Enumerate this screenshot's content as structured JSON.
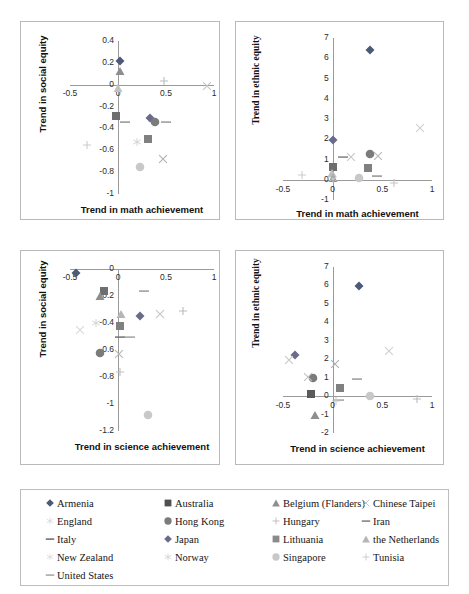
{
  "figure": {
    "title": "",
    "series_legend": [
      {
        "name": "Armenia",
        "marker": "diamond",
        "color": "#4a5a78"
      },
      {
        "name": "Australia",
        "marker": "square",
        "color": "#4f4f4f"
      },
      {
        "name": "Belgium (Flanders)",
        "marker": "triangle",
        "color": "#8e8e8e"
      },
      {
        "name": "Chinese Taipei",
        "marker": "x",
        "color": "#c0c0c0"
      },
      {
        "name": "England",
        "marker": "star",
        "color": "#d5d5d5"
      },
      {
        "name": "Hong Kong",
        "marker": "circle",
        "color": "#7b7b7b"
      },
      {
        "name": "Hungary",
        "marker": "plus",
        "color": "#bdbdbd"
      },
      {
        "name": "Iran",
        "marker": "dash",
        "color": "#6f6f6f"
      },
      {
        "name": "Italy",
        "marker": "dash",
        "color": "#5a5a5a"
      },
      {
        "name": "Japan",
        "marker": "diamond",
        "color": "#6a6a8a"
      },
      {
        "name": "Lithuania",
        "marker": "square",
        "color": "#8a8a8a"
      },
      {
        "name": "the Netherlands",
        "marker": "triangle",
        "color": "#b5b5b5"
      },
      {
        "name": "New Zealand",
        "marker": "star",
        "color": "#d8d8d8"
      },
      {
        "name": "Norway",
        "marker": "star",
        "color": "#cfcfcf"
      },
      {
        "name": "Singapore",
        "marker": "circle",
        "color": "#c8c8c8"
      },
      {
        "name": "Tunisia",
        "marker": "plus",
        "color": "#cccccc"
      },
      {
        "name": "United States",
        "marker": "dash",
        "color": "#9b9b9b"
      }
    ]
  },
  "chart_data": [
    {
      "id": "math-social",
      "type": "scatter",
      "position": "top-left",
      "title": "",
      "xlabel": "Trend in math achievement",
      "ylabel": "Trend in social equity",
      "xlim": [
        -0.5,
        1
      ],
      "ylim": [
        -1,
        0.4
      ],
      "xticks": [
        -0.5,
        0,
        0.5,
        1
      ],
      "xticklabels": [
        "-0.5",
        "0",
        "0.5",
        "1"
      ],
      "yticks": [
        -1,
        -0.8,
        -0.6,
        -0.4,
        -0.2,
        0,
        0.2,
        0.4
      ],
      "yticklabels": [
        "-1",
        "-0.8",
        "-0.6",
        "-0.4",
        "-0.2",
        "0",
        "0.2",
        "0.4"
      ],
      "grid": false,
      "points": [
        {
          "name": "Armenia",
          "x": 0.02,
          "y": 0.22,
          "marker": "diamond",
          "color": "#4a5a78"
        },
        {
          "name": "Belgium (Flanders)",
          "x": 0.02,
          "y": 0.13,
          "marker": "triangle",
          "color": "#8e8e8e"
        },
        {
          "name": "the Netherlands",
          "x": 0.0,
          "y": -0.03,
          "marker": "triangle",
          "color": "#c2c2c2"
        },
        {
          "name": "Hungary",
          "x": 0.48,
          "y": 0.03,
          "marker": "plus",
          "color": "#bdbdbd"
        },
        {
          "name": "Chinese Taipei",
          "x": 0.93,
          "y": -0.01,
          "marker": "x",
          "color": "#c5c5c5"
        },
        {
          "name": "Australia",
          "x": -0.02,
          "y": -0.29,
          "marker": "square",
          "color": "#6e6e6e"
        },
        {
          "name": "United States",
          "x": 0.07,
          "y": -0.34,
          "marker": "dash",
          "color": "#9b9b9b"
        },
        {
          "name": "Japan",
          "x": 0.33,
          "y": -0.3,
          "marker": "diamond",
          "color": "#6a6a8a"
        },
        {
          "name": "Hong Kong",
          "x": 0.39,
          "y": -0.34,
          "marker": "circle",
          "color": "#7b7b7b"
        },
        {
          "name": "Iran",
          "x": 0.5,
          "y": -0.34,
          "marker": "dash",
          "color": "#a0a0a0"
        },
        {
          "name": "Norway",
          "x": 0.2,
          "y": -0.52,
          "marker": "star",
          "color": "#cfcfcf"
        },
        {
          "name": "Lithuania",
          "x": 0.31,
          "y": -0.5,
          "marker": "square",
          "color": "#808080"
        },
        {
          "name": "Tunisia",
          "x": -0.32,
          "y": -0.55,
          "marker": "plus",
          "color": "#cccccc"
        },
        {
          "name": "Singapore",
          "x": 0.23,
          "y": -0.75,
          "marker": "circle",
          "color": "#c8c8c8"
        },
        {
          "name": "England",
          "x": 0.47,
          "y": -0.68,
          "marker": "x",
          "color": "#b0b0b0"
        }
      ]
    },
    {
      "id": "math-ethnic",
      "type": "scatter",
      "position": "top-right",
      "title": "",
      "xlabel": "Trend in math achievement",
      "ylabel": "Trend in ethnic equity",
      "xlim": [
        -0.5,
        1
      ],
      "ylim": [
        -1,
        7
      ],
      "xticks": [
        -0.5,
        0,
        0.5,
        1
      ],
      "xticklabels": [
        "-0.5",
        "0",
        "0.5",
        "1"
      ],
      "yticks": [
        -1,
        0,
        1,
        2,
        3,
        4,
        5,
        6,
        7
      ],
      "yticklabels": [
        "-1",
        "0",
        "1",
        "2",
        "3",
        "4",
        "5",
        "6",
        "7"
      ],
      "grid": false,
      "points": [
        {
          "name": "Armenia",
          "x": 0.38,
          "y": 6.4,
          "marker": "diamond",
          "color": "#4a5a78"
        },
        {
          "name": "Japan",
          "x": 0.0,
          "y": 1.97,
          "marker": "diamond",
          "color": "#6a6a8a"
        },
        {
          "name": "Chinese Taipei",
          "x": 0.88,
          "y": 2.55,
          "marker": "x",
          "color": "#d0d0d0"
        },
        {
          "name": "Hong Kong",
          "x": 0.38,
          "y": 1.27,
          "marker": "circle",
          "color": "#7b7b7b"
        },
        {
          "name": "England",
          "x": 0.46,
          "y": 1.18,
          "marker": "x",
          "color": "#b8b8b8"
        },
        {
          "name": "Italy",
          "x": 0.1,
          "y": 1.1,
          "marker": "dash",
          "color": "#8a8a8a"
        },
        {
          "name": "New Zealand",
          "x": 0.18,
          "y": 1.12,
          "marker": "x",
          "color": "#c7c7c7"
        },
        {
          "name": "Australia",
          "x": 0.0,
          "y": 0.62,
          "marker": "square",
          "color": "#6e6e6e"
        },
        {
          "name": "Lithuania",
          "x": 0.36,
          "y": 0.58,
          "marker": "square",
          "color": "#808080"
        },
        {
          "name": "the Netherlands",
          "x": -0.01,
          "y": 0.33,
          "marker": "triangle",
          "color": "#bdbdbd"
        },
        {
          "name": "Belgium (Flanders)",
          "x": 0.0,
          "y": 0.1,
          "marker": "triangle",
          "color": "#8e8e8e"
        },
        {
          "name": "Singapore",
          "x": 0.27,
          "y": 0.1,
          "marker": "circle",
          "color": "#c8c8c8"
        },
        {
          "name": "United States",
          "x": 0.45,
          "y": 0.18,
          "marker": "dash",
          "color": "#9b9b9b"
        },
        {
          "name": "Tunisia",
          "x": -0.31,
          "y": 0.22,
          "marker": "plus",
          "color": "#cccccc"
        },
        {
          "name": "Hungary",
          "x": 0.62,
          "y": -0.14,
          "marker": "plus",
          "color": "#c4c4c4"
        },
        {
          "name": "Norway",
          "x": 0.0,
          "y": 0.02,
          "marker": "star",
          "color": "#cfcfcf"
        }
      ]
    },
    {
      "id": "science-social",
      "type": "scatter",
      "position": "bottom-left",
      "title": "",
      "xlabel": "Trend in science achievement",
      "ylabel": "Trend in social equity",
      "xlim": [
        -0.5,
        1
      ],
      "ylim": [
        -1.2,
        0
      ],
      "xticks": [
        -0.5,
        0,
        0.5,
        1
      ],
      "xticklabels": [
        "-0.5",
        "0",
        "0.5",
        "1"
      ],
      "yticks": [
        -1.2,
        -1,
        -0.8,
        -0.6,
        -0.4,
        -0.2,
        0
      ],
      "yticklabels": [
        "-1.2",
        "-1",
        "-0.8",
        "-0.6",
        "-0.4",
        "-0.2",
        "0"
      ],
      "grid": false,
      "points": [
        {
          "name": "Armenia",
          "x": -0.44,
          "y": -0.03,
          "marker": "diamond",
          "color": "#4a5a78"
        },
        {
          "name": "Australia",
          "x": -0.15,
          "y": -0.16,
          "marker": "square",
          "color": "#6e6e6e"
        },
        {
          "name": "Belgium (Flanders)",
          "x": -0.19,
          "y": -0.2,
          "marker": "triangle",
          "color": "#8e8e8e"
        },
        {
          "name": "Iran",
          "x": 0.27,
          "y": -0.16,
          "marker": "dash",
          "color": "#a0a0a0"
        },
        {
          "name": "the Netherlands",
          "x": 0.03,
          "y": -0.33,
          "marker": "triangle",
          "color": "#b5b5b5"
        },
        {
          "name": "Japan",
          "x": 0.23,
          "y": -0.35,
          "marker": "diamond",
          "color": "#6a6a8a"
        },
        {
          "name": "England",
          "x": 0.44,
          "y": -0.33,
          "marker": "x",
          "color": "#c6c6c6"
        },
        {
          "name": "Hungary",
          "x": 0.68,
          "y": -0.31,
          "marker": "plus",
          "color": "#bdbdbd"
        },
        {
          "name": "Lithuania",
          "x": 0.02,
          "y": -0.42,
          "marker": "square",
          "color": "#808080"
        },
        {
          "name": "Norway",
          "x": -0.23,
          "y": -0.4,
          "marker": "star",
          "color": "#cfcfcf"
        },
        {
          "name": "Tunisia",
          "x": -0.4,
          "y": -0.45,
          "marker": "x",
          "color": "#d8d8d8"
        },
        {
          "name": "Italy",
          "x": 0.02,
          "y": -0.5,
          "marker": "dash",
          "color": "#7a7a7a"
        },
        {
          "name": "United States",
          "x": 0.12,
          "y": -0.5,
          "marker": "dash",
          "color": "#a8a8a8"
        },
        {
          "name": "Hong Kong",
          "x": -0.19,
          "y": -0.62,
          "marker": "circle",
          "color": "#7b7b7b"
        },
        {
          "name": "Chinese Taipei",
          "x": 0.01,
          "y": -0.63,
          "marker": "x",
          "color": "#b6b6b6"
        },
        {
          "name": "New Zealand",
          "x": 0.02,
          "y": -0.76,
          "marker": "plus",
          "color": "#c0c0c0"
        },
        {
          "name": "Singapore",
          "x": 0.31,
          "y": -1.08,
          "marker": "circle",
          "color": "#c8c8c8"
        }
      ]
    },
    {
      "id": "science-ethnic",
      "type": "scatter",
      "position": "bottom-right",
      "title": "",
      "xlabel": "Trend in science achievement",
      "ylabel": "Trend in ethnic equity",
      "xlim": [
        -0.5,
        1
      ],
      "ylim": [
        -2,
        7
      ],
      "xticks": [
        -0.5,
        0,
        0.5,
        1
      ],
      "xticklabels": [
        "-0.5",
        "0",
        "0.5",
        "1"
      ],
      "yticks": [
        -2,
        -1,
        0,
        1,
        2,
        3,
        4,
        5,
        6,
        7
      ],
      "yticklabels": [
        "-2",
        "-1",
        "0",
        "1",
        "2",
        "3",
        "4",
        "5",
        "6",
        "7"
      ],
      "grid": false,
      "points": [
        {
          "name": "Armenia",
          "x": 0.27,
          "y": 5.95,
          "marker": "diamond",
          "color": "#4a5a78"
        },
        {
          "name": "Japan",
          "x": -0.38,
          "y": 2.25,
          "marker": "diamond",
          "color": "#6a6a8a"
        },
        {
          "name": "Chinese Taipei",
          "x": 0.57,
          "y": 2.45,
          "marker": "x",
          "color": "#d0d0d0"
        },
        {
          "name": "England",
          "x": -0.44,
          "y": 1.95,
          "marker": "x",
          "color": "#c8c8c8"
        },
        {
          "name": "New Zealand",
          "x": 0.02,
          "y": 1.72,
          "marker": "x",
          "color": "#b0b0b0"
        },
        {
          "name": "Hong Kong",
          "x": -0.2,
          "y": 1.0,
          "marker": "circle",
          "color": "#7b7b7b"
        },
        {
          "name": "Norway",
          "x": -0.25,
          "y": 1.05,
          "marker": "x",
          "color": "#c2c2c2"
        },
        {
          "name": "Iran",
          "x": 0.24,
          "y": 0.92,
          "marker": "dash",
          "color": "#a0a0a0"
        },
        {
          "name": "Lithuania",
          "x": 0.07,
          "y": 0.45,
          "marker": "square",
          "color": "#808080"
        },
        {
          "name": "Australia",
          "x": -0.22,
          "y": 0.1,
          "marker": "square",
          "color": "#5a5a5a"
        },
        {
          "name": "Singapore",
          "x": 0.38,
          "y": 0.02,
          "marker": "circle",
          "color": "#c8c8c8"
        },
        {
          "name": "United States",
          "x": 0.06,
          "y": -0.22,
          "marker": "dash",
          "color": "#a8a8a8"
        },
        {
          "name": "Tunisia",
          "x": 0.03,
          "y": -0.28,
          "marker": "plus",
          "color": "#cccccc"
        },
        {
          "name": "Hungary",
          "x": 0.85,
          "y": -0.18,
          "marker": "plus",
          "color": "#bdbdbd"
        },
        {
          "name": "Belgium (Flanders)",
          "x": -0.18,
          "y": -1.0,
          "marker": "triangle",
          "color": "#8e8e8e"
        }
      ]
    }
  ]
}
